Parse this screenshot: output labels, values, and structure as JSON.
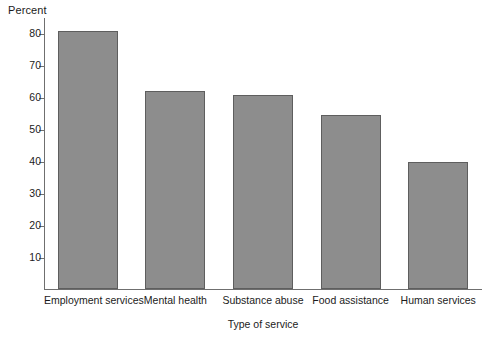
{
  "chart_data": {
    "type": "bar",
    "title": "",
    "categories": [
      "Employment services",
      "Mental health",
      "Substance abuse",
      "Food assistance",
      "Human services"
    ],
    "values": [
      80.5,
      62.0,
      60.5,
      54.5,
      39.7
    ],
    "series": [
      {
        "name": "Percent",
        "values": [
          80.5,
          62.0,
          60.5,
          54.5,
          39.7
        ]
      }
    ],
    "xlabel": "Type of service",
    "ylabel": "Percent",
    "ylim": [
      0,
      85
    ],
    "yticks": [
      10,
      20,
      30,
      40,
      50,
      60,
      70,
      80
    ],
    "ytick_labels": [
      "10",
      "20",
      "30",
      "40",
      "50",
      "60",
      "70",
      "80"
    ],
    "grid": false,
    "legend": false,
    "legend_position": "none",
    "bar_color": "#8d8d8d",
    "bar_edge_color": "#5e5e5e",
    "axis_color": "#6f6f6f",
    "text_color": "#1b1b1b",
    "background": "#ffffff"
  },
  "caption": ""
}
